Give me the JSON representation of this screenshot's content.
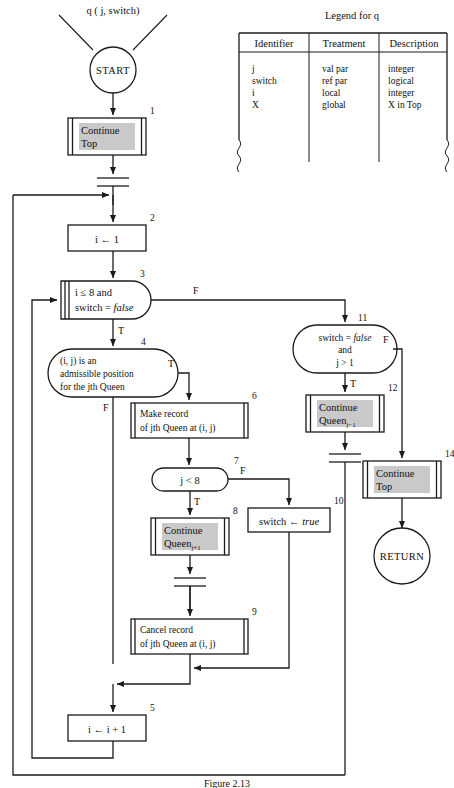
{
  "figure": {
    "caption": "Figure 2.13",
    "call_label": "q ( j, switch)"
  },
  "legend": {
    "title": "Legend for q",
    "headers": [
      "Identifier",
      "Treatment",
      "Description"
    ],
    "rows": [
      {
        "identifier": "j",
        "treatment": "val par",
        "description": "integer"
      },
      {
        "identifier": "switch",
        "treatment": "ref par",
        "description": "logical"
      },
      {
        "identifier": "i",
        "treatment": "local",
        "description": "integer"
      },
      {
        "identifier": "X",
        "treatment": "global",
        "description": "X in Top"
      }
    ]
  },
  "terminals": {
    "start": "START",
    "return": "RETURN"
  },
  "nodes": [
    {
      "id": "1",
      "number": "1",
      "kind": "call",
      "lines": [
        "Continue",
        "Top"
      ]
    },
    {
      "id": "2",
      "number": "2",
      "kind": "process",
      "lines": [
        "i ← 1"
      ]
    },
    {
      "id": "3",
      "number": "3",
      "kind": "decision-call",
      "lines": [
        "i ≤ 8 and",
        "switch = false"
      ]
    },
    {
      "id": "4",
      "number": "4",
      "kind": "decision",
      "lines": [
        "(i, j) is an",
        "admissible position",
        "for the jth Queen"
      ]
    },
    {
      "id": "5",
      "number": "5",
      "kind": "process",
      "lines": [
        "i ← i + 1"
      ]
    },
    {
      "id": "6",
      "number": "6",
      "kind": "process-d",
      "lines": [
        "Make record",
        "of jth Queen at (i, j)"
      ]
    },
    {
      "id": "7",
      "number": "7",
      "kind": "decision",
      "lines": [
        "j < 8"
      ]
    },
    {
      "id": "8",
      "number": "8",
      "kind": "call",
      "lines": [
        "Continue",
        "Queen"
      ],
      "subscript": "j+1"
    },
    {
      "id": "9",
      "number": "9",
      "kind": "process-d",
      "lines": [
        "Cancel record",
        "of jth Queen at (i, j)"
      ]
    },
    {
      "id": "10",
      "number": "10",
      "kind": "process",
      "lines": [
        "switch ← true"
      ]
    },
    {
      "id": "11",
      "number": "11",
      "kind": "decision",
      "lines": [
        "switch = false",
        "and",
        "j > 1"
      ]
    },
    {
      "id": "12",
      "number": "12",
      "kind": "call",
      "lines": [
        "Continue",
        "Queen"
      ],
      "subscript": "j−1"
    },
    {
      "id": "14",
      "number": "14",
      "kind": "call",
      "lines": [
        "Continue",
        "Top"
      ]
    }
  ],
  "branch_labels": {
    "n3_false": "F",
    "n3_true": "T",
    "n4_true": "T",
    "n4_false": "F",
    "n7_false": "F",
    "n7_true": "T",
    "n11_false": "F",
    "n11_true": "T"
  },
  "italic_tokens": [
    "false",
    "true"
  ],
  "colors": {
    "ink": "#1b1b1b",
    "shade": "#c9c9c9",
    "paper": "#ffffff"
  }
}
